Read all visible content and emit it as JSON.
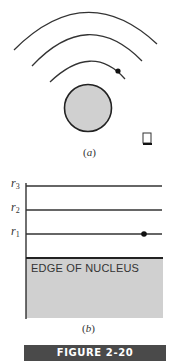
{
  "figure": {
    "banner_label": "FIGURE 2-20",
    "banner_color": "#4a4a4a"
  },
  "panel_a": {
    "caption_open": "(",
    "caption_letter": "a",
    "caption_close": ")",
    "orbit_count": 3,
    "electron_on_orbit": 1,
    "nucleus_fill": "#d0d0d0"
  },
  "panel_b": {
    "caption_open": "(",
    "caption_letter": "b",
    "caption_close": ")",
    "levels": [
      {
        "symbol": "r",
        "subscript": "3"
      },
      {
        "symbol": "r",
        "subscript": "2"
      },
      {
        "symbol": "r",
        "subscript": "1"
      }
    ],
    "electron_level": "r1",
    "nucleus_label": "EDGE OF NUCLEUS",
    "nucleus_fill": "#d0d0d0"
  }
}
